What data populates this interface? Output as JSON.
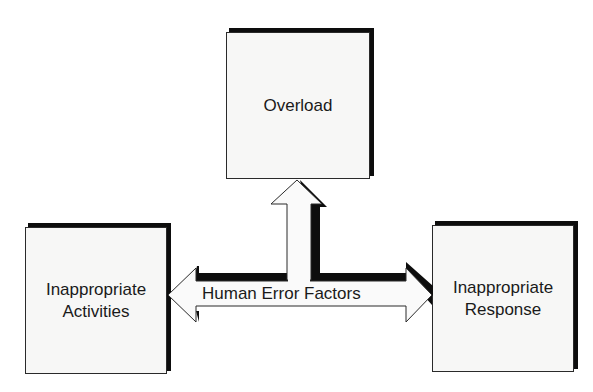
{
  "diagram": {
    "boxes": {
      "top": {
        "label": "Overload"
      },
      "left": {
        "line1": "Inappropriate",
        "line2": "Activities"
      },
      "right": {
        "line1": "Inappropriate",
        "line2": "Response"
      }
    },
    "connector": {
      "label": "Human Error Factors"
    },
    "colors": {
      "box_fill": "#f7f7f6",
      "border": "#2a2a2a",
      "shadow": "#0d0d0d",
      "background": "#ffffff"
    }
  }
}
